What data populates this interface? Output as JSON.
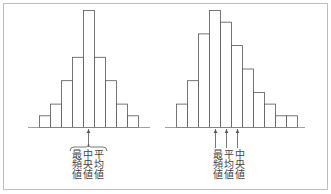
{
  "chart_data": [
    {
      "type": "bar",
      "title": "",
      "subtitle": "Symmetric distribution",
      "categories": [
        "1",
        "2",
        "3",
        "4",
        "5",
        "6",
        "7",
        "8",
        "9"
      ],
      "values": [
        1,
        2,
        4,
        6,
        10,
        6,
        4,
        2,
        1
      ],
      "xlabel": "",
      "ylabel": "",
      "grid": false,
      "annotations": [
        {
          "label": "最頻値",
          "position": 5
        },
        {
          "label": "中央値",
          "position": 5
        },
        {
          "label": "平均値",
          "position": 5
        }
      ]
    },
    {
      "type": "bar",
      "title": "",
      "subtitle": "Right-skewed distribution",
      "categories": [
        "1",
        "2",
        "3",
        "4",
        "5",
        "6",
        "7",
        "8",
        "9",
        "10",
        "11"
      ],
      "values": [
        2,
        4,
        8,
        10,
        9,
        7,
        5,
        3,
        2,
        1,
        1
      ],
      "xlabel": "",
      "ylabel": "",
      "grid": false,
      "annotations": [
        {
          "label": "最頻値",
          "position": 4
        },
        {
          "label": "平均値",
          "position": 5
        },
        {
          "label": "中央値",
          "position": 6
        }
      ]
    }
  ],
  "left": {
    "labels": [
      "最頻値",
      "中央値",
      "平均値"
    ]
  },
  "right": {
    "labels": [
      "最頻値",
      "平均値",
      "中央値"
    ]
  },
  "colors": {
    "line": "#555555",
    "frame": "#bdbdbd",
    "text": "#444444"
  }
}
